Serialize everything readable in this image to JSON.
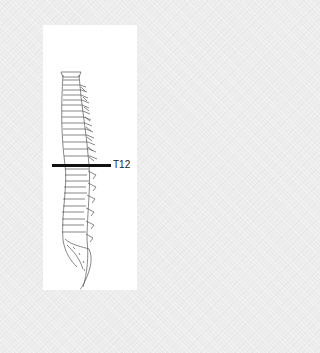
{
  "figure": {
    "marker": {
      "label": "T12",
      "color": "#111111"
    },
    "background_color": "#ececec",
    "panel_color": "#ffffff",
    "line_art_color": "#555555"
  }
}
